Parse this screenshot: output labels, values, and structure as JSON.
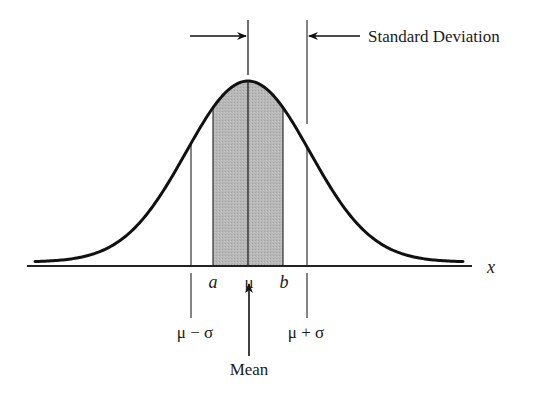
{
  "diagram": {
    "labels": {
      "standard_deviation": "Standard Deviation",
      "mean": "Mean",
      "mu_minus_sigma": "μ − σ",
      "mu_plus_sigma": "μ + σ",
      "a": "a",
      "mu": "μ",
      "b": "b",
      "x_axis": "x"
    },
    "colors": {
      "curve": "#111111",
      "lines": "#222222",
      "shaded_region": "#b3b3b3",
      "background": "#ffffff"
    },
    "geometry": {
      "mean_px": 248,
      "sigma_px": 62,
      "peak_y": 81,
      "baseline_y": 262,
      "axis_y": 266,
      "axis_x_start": 27,
      "axis_x_end": 472,
      "curve_x_start": 35,
      "curve_x_end": 463,
      "shade_a_px": 213,
      "shade_b_px": 283,
      "sigma_left_px": 191,
      "sigma_right_px": 307
    }
  }
}
